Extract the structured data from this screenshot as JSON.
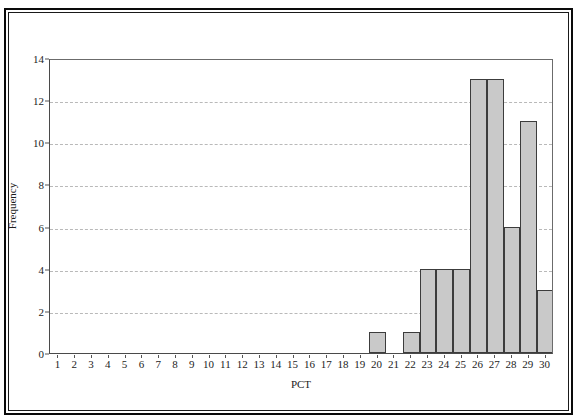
{
  "chart_data": {
    "type": "bar",
    "title": "",
    "xlabel": "PCT",
    "ylabel": "Frequency",
    "categories": [
      1,
      2,
      3,
      4,
      5,
      6,
      7,
      8,
      9,
      10,
      11,
      12,
      13,
      14,
      15,
      16,
      17,
      18,
      19,
      20,
      21,
      22,
      23,
      24,
      25,
      26,
      27,
      28,
      29,
      30
    ],
    "values": [
      0,
      0,
      0,
      0,
      0,
      0,
      0,
      0,
      0,
      0,
      0,
      0,
      0,
      0,
      0,
      0,
      0,
      0,
      0,
      1,
      0,
      1,
      4,
      4,
      4,
      13,
      13,
      6,
      11,
      3
    ],
    "xlim": [
      0.5,
      30.5
    ],
    "ylim": [
      0,
      14
    ],
    "y_ticks": [
      0,
      2,
      4,
      6,
      8,
      10,
      12,
      14
    ],
    "x_ticks": [
      1,
      2,
      3,
      4,
      5,
      6,
      7,
      8,
      9,
      10,
      11,
      12,
      13,
      14,
      15,
      16,
      17,
      18,
      19,
      20,
      21,
      22,
      23,
      24,
      25,
      26,
      27,
      28,
      29,
      30
    ],
    "grid": true,
    "grid_axis": "y",
    "grid_style": "dashed",
    "legend": null,
    "legend_position": "none",
    "bar_fill_color": "#c9c9c9",
    "bar_edge_color": "#3c3c3c",
    "gridline_color": "#b9b9b9",
    "axis_color": "#4a4a4a",
    "background_color": "#ffffff",
    "frame_color": "#0a0a0a"
  }
}
